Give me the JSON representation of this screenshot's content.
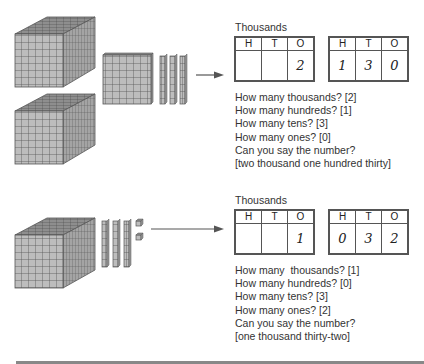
{
  "examples": [
    {
      "blocks": {
        "thousands": 2,
        "hundreds": 1,
        "tens": 3,
        "ones": 0
      },
      "group_label": "Thousands",
      "thousands_chart": {
        "headers": [
          "H",
          "T",
          "O"
        ],
        "values": [
          "",
          "",
          "2"
        ]
      },
      "units_chart": {
        "headers": [
          "H",
          "T",
          "O"
        ],
        "values": [
          "1",
          "3",
          "0"
        ]
      },
      "questions": [
        "How many thousands? [2]",
        "How many hundreds? [1]",
        "How many tens? [3]",
        "How many ones? [0]",
        "Can you say the number?",
        "[two thousand one hundred thirty]"
      ]
    },
    {
      "blocks": {
        "thousands": 1,
        "hundreds": 0,
        "tens": 3,
        "ones": 2
      },
      "group_label": "Thousands",
      "thousands_chart": {
        "headers": [
          "H",
          "T",
          "O"
        ],
        "values": [
          "",
          "",
          "1"
        ]
      },
      "units_chart": {
        "headers": [
          "H",
          "T",
          "O"
        ],
        "values": [
          "0",
          "3",
          "2"
        ]
      },
      "questions": [
        "How many  thousands? [1]",
        "How many hundreds? [0]",
        "How many tens? [3]",
        "How many ones? [2]",
        "Can you say the number?",
        "[one thousand thirty-two]"
      ]
    }
  ],
  "colors": {
    "block_face": "#b9b9b9",
    "block_grid": "#555555",
    "block_top": "#8a8a8a",
    "block_side": "#9e9e9e",
    "arrow": "#555555",
    "rule": "#888888"
  }
}
